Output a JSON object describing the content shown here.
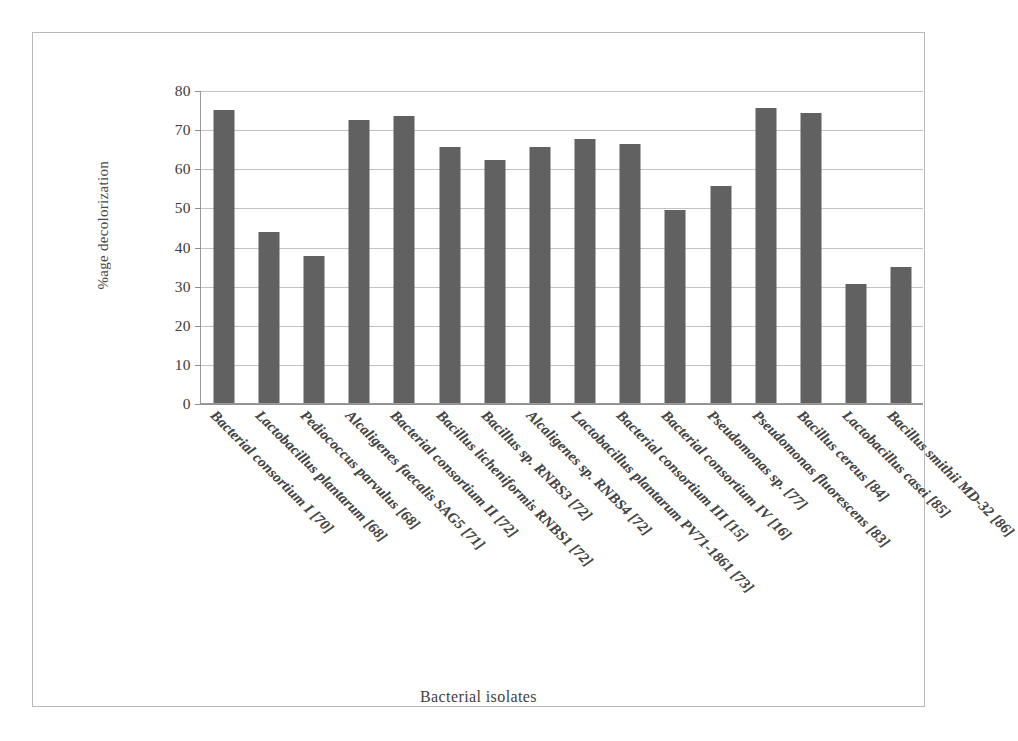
{
  "figure": {
    "y_axis_title": "%age decolorization",
    "x_axis_title": "Bacterial isolates",
    "bar_color": "#616161",
    "grid_color": "#c2c2c2",
    "axis_color": "#8f8f8f",
    "frame_color": "#b9b9b9",
    "background": "#ffffff"
  },
  "chart_data": {
    "type": "bar",
    "title": "",
    "subtitle": "",
    "xlabel": "Bacterial isolates",
    "ylabel": "%age decolorization",
    "ylim": [
      0,
      80
    ],
    "yticks": [
      0,
      10,
      20,
      30,
      40,
      50,
      60,
      70,
      80
    ],
    "ytick_labels": [
      "0",
      "10",
      "20",
      "30",
      "40",
      "50",
      "60",
      "70",
      "80"
    ],
    "grid": true,
    "grid_axis": "y",
    "legend": false,
    "legend_position": "none",
    "orientation": "vertical",
    "categories": [
      "Bacterial consortium I [70]",
      "Lactobacillus plantarum [68]",
      "Pediococcus parvulus [68]",
      "Alcaligenes faecalis SAG5 [71]",
      "Bacterial consortium II [72]",
      "Bacillus licheniformis RNBS1 [72]",
      "Bacillus sp. RNBS3 [72]",
      "Alcaligenes sp. RNBS4 [72]",
      "Lactobacillus plantarum PV71-1861 [73]",
      "Bacterial consortium III [15]",
      "Bacterial consortium IV [16]",
      "Pseudomonas sp. [77]",
      "Pseudomonas fluorescens [83]",
      "Bacillus cereus [84]",
      "Lactobacillus casei [85]",
      "Bacillus smithii MD-32 [86]"
    ],
    "values": [
      75.0,
      43.8,
      37.7,
      72.3,
      73.4,
      65.5,
      62.2,
      65.4,
      67.6,
      66.3,
      49.3,
      55.4,
      75.5,
      74.2,
      30.5,
      34.8
    ],
    "series": [
      {
        "name": "%age decolorization",
        "color": "#616161",
        "values": [
          75.0,
          43.8,
          37.7,
          72.3,
          73.4,
          65.5,
          62.2,
          65.4,
          67.6,
          66.3,
          49.3,
          55.4,
          75.5,
          74.2,
          30.5,
          34.8
        ]
      }
    ]
  }
}
